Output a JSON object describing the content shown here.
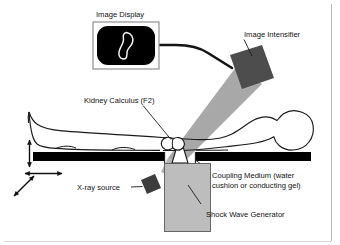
{
  "figure": {
    "title_alt": "Extracorporeal Shock Wave Lithotripsy Setup",
    "labels": {
      "image_display": "Image Display",
      "image_intensifier": "Image Intensifier",
      "kidney_calculus": "Kidney Calculus (F2)",
      "coupling_medium_line1": "Coupling Medium (water",
      "coupling_medium_line2": "cushion or conducting gel)",
      "xray_source": "X-ray source",
      "shock_wave_generator": "Shock Wave Generator"
    },
    "colors": {
      "background": "#ffffff",
      "outline": "#1a1a1a",
      "table_black": "#000000",
      "monitor_screen": "#000000",
      "kidney_outline": "#f2f2f2",
      "intensifier_fill": "#4d4d4d",
      "xray_source_fill": "#3d3d3d",
      "beam_fill": "#a8a8a8",
      "generator_fill": "#bdbdbd",
      "frame_line": "#b9b9b9",
      "text": "#111111"
    },
    "parts": [
      {
        "name": "image-display-monitor",
        "kind": "monitor"
      },
      {
        "name": "kidney-stone-image",
        "kind": "kidney-outline"
      },
      {
        "name": "signal-cable",
        "kind": "cable"
      },
      {
        "name": "image-intensifier-block",
        "kind": "rotated-square"
      },
      {
        "name": "xray-beam-cone",
        "kind": "cone"
      },
      {
        "name": "patient-body-outline",
        "kind": "silhouette"
      },
      {
        "name": "kidney-calculus-focus",
        "kind": "kidney-focus"
      },
      {
        "name": "treatment-table",
        "kind": "bar-split"
      },
      {
        "name": "coupling-medium-bellows",
        "kind": "trumpet"
      },
      {
        "name": "shock-wave-generator-body",
        "kind": "rect"
      },
      {
        "name": "xray-source-block",
        "kind": "rotated-square"
      },
      {
        "name": "table-motion-arrow-vertical",
        "kind": "arrow"
      },
      {
        "name": "table-motion-arrow-horizontal",
        "kind": "arrow"
      },
      {
        "name": "table-motion-arrow-diagonal",
        "kind": "arrow"
      }
    ]
  }
}
